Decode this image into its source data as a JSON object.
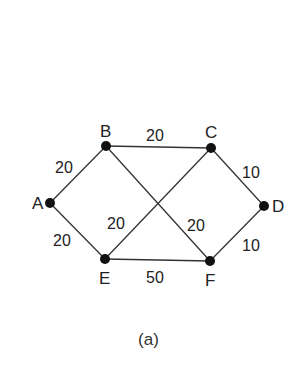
{
  "figure": {
    "caption": "(a)",
    "nodes": [
      {
        "id": "A",
        "x": 50,
        "y": 203,
        "label_dx": -18,
        "label_dy": 6
      },
      {
        "id": "B",
        "x": 106,
        "y": 146,
        "label_dx": -6,
        "label_dy": -9
      },
      {
        "id": "C",
        "x": 211,
        "y": 148,
        "label_dx": -6,
        "label_dy": -10
      },
      {
        "id": "D",
        "x": 264,
        "y": 206,
        "label_dx": 8,
        "label_dy": 6
      },
      {
        "id": "E",
        "x": 105,
        "y": 259,
        "label_dx": -6,
        "label_dy": 25
      },
      {
        "id": "F",
        "x": 210,
        "y": 261,
        "label_dx": -5,
        "label_dy": 25
      }
    ],
    "edges": [
      {
        "from": "A",
        "to": "B",
        "weight": "20",
        "lx": 55,
        "ly": 173
      },
      {
        "from": "A",
        "to": "E",
        "weight": "20",
        "lx": 53,
        "ly": 246
      },
      {
        "from": "B",
        "to": "C",
        "weight": "20",
        "lx": 146,
        "ly": 141
      },
      {
        "from": "B",
        "to": "F",
        "weight": "20",
        "lx": 187,
        "ly": 231
      },
      {
        "from": "E",
        "to": "C",
        "weight": "20",
        "lx": 107,
        "ly": 229
      },
      {
        "from": "C",
        "to": "D",
        "weight": "10",
        "lx": 242,
        "ly": 178
      },
      {
        "from": "F",
        "to": "D",
        "weight": "10",
        "lx": 242,
        "ly": 251
      },
      {
        "from": "E",
        "to": "F",
        "weight": "50",
        "lx": 146,
        "ly": 283
      }
    ]
  }
}
